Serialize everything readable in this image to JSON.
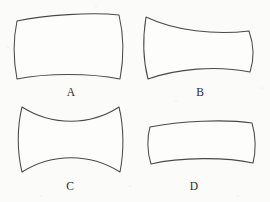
{
  "figure": {
    "background_color": "#fbfbf9",
    "stroke_color": "#4a4a4a",
    "fill_color": "#fdfdfc",
    "label_color": "#2a2a2a",
    "width": 270,
    "height": 202,
    "style": "hand-drawn line art, four curved-sided quadrilaterals on paper",
    "shapes": [
      {
        "id": "A",
        "label": "A",
        "description": "rectangle with convex bulging sides, cushion shape",
        "curvature": "convex",
        "label_x": 71,
        "label_y": 96,
        "path": "M 17,21 C 45,15 92,12 119,15 C 124,36 124,58 120,79 C 90,73 46,73 17,79 C 13,58 13,40 17,21 Z"
      },
      {
        "id": "B",
        "label": "B",
        "description": "asymmetric cushion, left side taller than right, top slopes down to the right",
        "curvature": "convex-asymmetric",
        "label_x": 200,
        "label_y": 96,
        "path": "M 146,17 C 175,31 215,35 249,31 C 254,45 254,60 250,72 C 216,65 176,69 148,79 C 143,60 143,36 146,17 Z"
      },
      {
        "id": "C",
        "label": "C",
        "description": "hourglass or spool shape with deeply concave top and bottom edges",
        "curvature": "concave",
        "label_x": 70,
        "label_y": 190,
        "path": "M 22,107 C 52,126 90,126 119,107 C 124,127 124,152 120,172 C 90,153 52,153 22,172 C 17,152 17,127 22,107 Z"
      },
      {
        "id": "D",
        "label": "D",
        "description": "flat wide cushion, shorter and more elongated than A",
        "curvature": "convex",
        "label_x": 194,
        "label_y": 190,
        "path": "M 150,127 C 180,121 225,119 252,123 C 256,136 256,152 253,163 C 226,157 180,157 151,164 C 147,152 147,137 150,127 Z"
      }
    ],
    "specks": [
      {
        "x": 8,
        "y": 47,
        "r": 0.5
      },
      {
        "x": 262,
        "y": 88,
        "r": 0.5
      },
      {
        "x": 130,
        "y": 186,
        "r": 0.5
      },
      {
        "x": 41,
        "y": 196,
        "r": 0.5
      },
      {
        "x": 238,
        "y": 196,
        "r": 0.5
      },
      {
        "x": 96,
        "y": 6,
        "r": 0.5
      },
      {
        "x": 176,
        "y": 101,
        "r": 0.5
      }
    ]
  }
}
